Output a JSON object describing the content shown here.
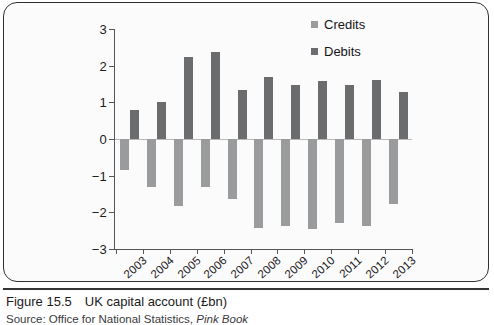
{
  "figure": {
    "caption_number": "Figure 15.5",
    "caption_text": "UK capital account (£bn)",
    "source_prefix": "Source: Office for National Statistics, ",
    "source_italic": "Pink Book"
  },
  "legend": {
    "position": "top-right",
    "items": [
      {
        "label": "Credits",
        "color": "#9a9b9d",
        "icon": "square-swatch-icon"
      },
      {
        "label": "Debits",
        "color": "#6b6c6e",
        "icon": "square-swatch-icon"
      }
    ]
  },
  "chart_data": {
    "type": "bar",
    "title": "UK capital account (£bn)",
    "xlabel": "",
    "ylabel": "",
    "ylim": [
      -3,
      3
    ],
    "yticks": [
      3,
      2,
      1,
      0,
      -1,
      -2,
      -3
    ],
    "ytick_labels": [
      "3",
      "2",
      "1",
      "0",
      "−1",
      "−2",
      "−3"
    ],
    "grid": false,
    "zero_line": true,
    "legend_position": "top-right",
    "categories": [
      "2003",
      "2004",
      "2005",
      "2006",
      "2007",
      "2008",
      "2009",
      "2010",
      "2011",
      "2012",
      "2013"
    ],
    "series": [
      {
        "name": "Debits",
        "color": "#6b6c6e",
        "values": [
          0.78,
          1.02,
          2.25,
          2.38,
          1.33,
          1.68,
          1.46,
          1.58,
          1.48,
          1.6,
          1.28
        ]
      },
      {
        "name": "Credits",
        "color": "#9a9b9d",
        "values": [
          -0.85,
          -1.32,
          -1.83,
          -1.31,
          -1.63,
          -2.42,
          -2.36,
          -2.46,
          -2.29,
          -2.38,
          -1.78
        ]
      }
    ]
  }
}
